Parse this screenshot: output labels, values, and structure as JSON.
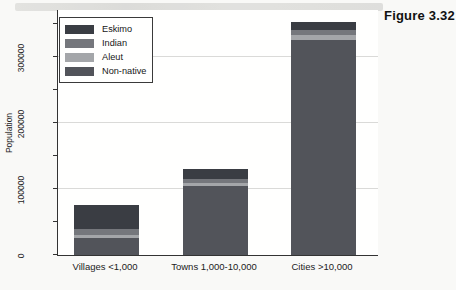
{
  "figure_label": "Figure 3.32",
  "chart_data": {
    "type": "bar",
    "stacked": true,
    "title": "",
    "xlabel": "",
    "ylabel": "Population",
    "categories": [
      "Villages <1,000",
      "Towns 1,000-10,000",
      "Cities >10,000"
    ],
    "series": [
      {
        "name": "Eskimo",
        "color": "#3a3d43",
        "values": [
          35000,
          15000,
          12000
        ]
      },
      {
        "name": "Indian",
        "color": "#75777c",
        "values": [
          9000,
          6000,
          8000
        ]
      },
      {
        "name": "Aleut",
        "color": "#a4a6a9",
        "values": [
          6000,
          5000,
          7000
        ]
      },
      {
        "name": "Non-native",
        "color": "#52545a",
        "values": [
          25000,
          104000,
          325000
        ]
      }
    ],
    "stack_order_bottom_to_top": [
      "Non-native",
      "Aleut",
      "Indian",
      "Eskimo"
    ],
    "legend_order_top_to_bottom": [
      "Eskimo",
      "Indian",
      "Aleut",
      "Non-native"
    ],
    "legend_position": "top-left",
    "ylim": [
      0,
      372000
    ],
    "yticks_labeled": [
      "0",
      "100000",
      "200000",
      "300000"
    ],
    "ytick_interval": 50000,
    "ytick_max": 350000,
    "gridlines": [
      100000,
      200000,
      300000
    ],
    "grid": true
  },
  "colors": {
    "axis": "#333333",
    "gridline": "#dadad8",
    "plot_background": "#fffffe",
    "page_background": "#f9f9f7",
    "scan_band": "#d6d6d3",
    "text": "#1c1c1c"
  }
}
